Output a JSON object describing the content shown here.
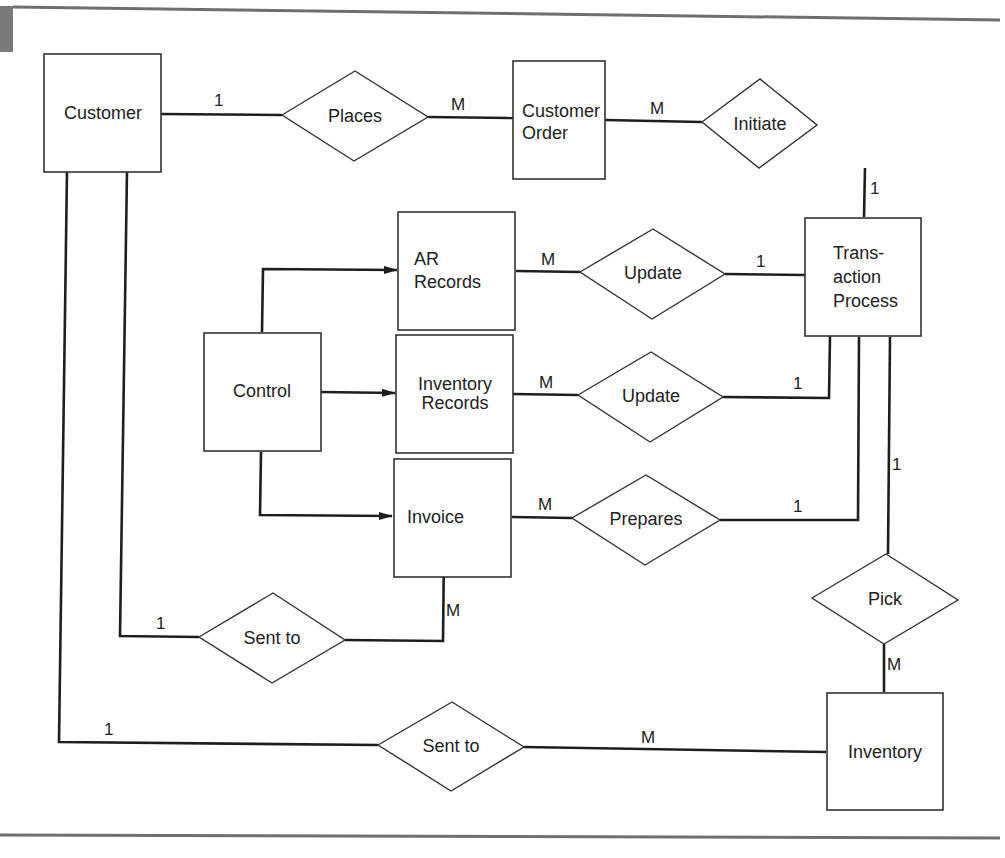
{
  "diagram": {
    "type": "entity-relationship",
    "colors": {
      "line": "#1e1e1e",
      "box_border": "#333333",
      "text": "#222222",
      "rule": "#6f6f6f",
      "corner_tab": "#7a7a7a"
    },
    "entities": {
      "customer": {
        "label": [
          "Customer"
        ]
      },
      "customer_order": {
        "label": [
          "Customer",
          "Order"
        ]
      },
      "ar_records": {
        "label": [
          "AR",
          "Records"
        ]
      },
      "control": {
        "label": [
          "Control"
        ]
      },
      "inventory_records": {
        "label": [
          "Inventory",
          "Records"
        ]
      },
      "invoice": {
        "label": [
          "Invoice"
        ]
      },
      "transaction_process": {
        "label": [
          "Trans-",
          "action",
          "Process"
        ]
      },
      "inventory": {
        "label": [
          "Inventory"
        ]
      }
    },
    "relationships": {
      "places": {
        "label": "Places"
      },
      "initiate": {
        "label": "Initiate"
      },
      "update_ar": {
        "label": "Update"
      },
      "update_inv": {
        "label": "Update"
      },
      "prepares": {
        "label": "Prepares"
      },
      "pick": {
        "label": "Pick"
      },
      "sent_to_invoice": {
        "label": "Sent to"
      },
      "sent_to_inventory": {
        "label": "Sent to"
      }
    },
    "cardinalities": {
      "customer_places": "1",
      "places_order": "M",
      "order_initiate": "M",
      "initiate_tp": "1",
      "ar_update": "M",
      "update_tp_ar": "1",
      "invrec_update": "M",
      "update_tp_inv": "1",
      "invoice_prepares": "M",
      "prepares_tp": "1",
      "tp_pick": "1",
      "pick_inventory": "M",
      "invoice_sentto": "M",
      "customer_sentto_invoice": "1",
      "customer_sentto_inventory": "1",
      "sentto_inventory": "M"
    },
    "flows": [
      {
        "from": "Control",
        "to": "AR Records"
      },
      {
        "from": "Control",
        "to": "Inventory Records"
      },
      {
        "from": "Control",
        "to": "Invoice"
      }
    ]
  }
}
